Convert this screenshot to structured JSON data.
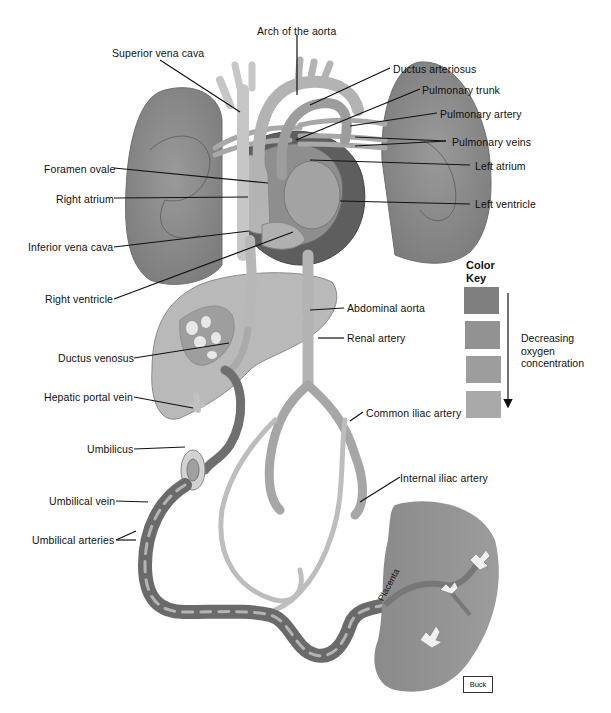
{
  "figure": {
    "labels_left": [
      {
        "id": "superior-vena-cava",
        "text": "Superior vena cava"
      },
      {
        "id": "foramen-ovale",
        "text": "Foramen ovale"
      },
      {
        "id": "right-atrium",
        "text": "Right atrium"
      },
      {
        "id": "inferior-vena-cava",
        "text": "Inferior vena cava"
      },
      {
        "id": "right-ventricle",
        "text": "Right ventricle"
      },
      {
        "id": "ductus-venosus",
        "text": "Ductus venosus"
      },
      {
        "id": "hepatic-portal-vein",
        "text": "Hepatic portal vein"
      },
      {
        "id": "umbilicus",
        "text": "Umbilicus"
      },
      {
        "id": "umbilical-vein",
        "text": "Umbilical vein"
      },
      {
        "id": "umbilical-arteries",
        "text": "Umbilical arteries"
      }
    ],
    "labels_top": [
      {
        "id": "arch-of-the-aorta",
        "text": "Arch of the aorta"
      }
    ],
    "labels_right": [
      {
        "id": "ductus-arteriosus",
        "text": "Ductus arteriosus"
      },
      {
        "id": "pulmonary-trunk",
        "text": "Pulmonary trunk"
      },
      {
        "id": "pulmonary-artery",
        "text": "Pulmonary artery"
      },
      {
        "id": "pulmonary-veins",
        "text": "Pulmonary veins"
      },
      {
        "id": "left-atrium",
        "text": "Left atrium"
      },
      {
        "id": "left-ventricle",
        "text": "Left ventricle"
      },
      {
        "id": "abdominal-aorta",
        "text": "Abdominal aorta"
      },
      {
        "id": "renal-artery",
        "text": "Renal artery"
      },
      {
        "id": "common-iliac-artery",
        "text": "Common iliac artery"
      },
      {
        "id": "internal-iliac-artery",
        "text": "Internal iliac artery"
      }
    ],
    "placenta_label": "Placenta",
    "credit": "Buck"
  },
  "color_key": {
    "title_line1": "Color",
    "title_line2": "Key",
    "swatches": [
      {
        "color": "#7f7f7f"
      },
      {
        "color": "#929292"
      },
      {
        "color": "#9d9d9d"
      },
      {
        "color": "#a9a9a9"
      }
    ],
    "description_line1": "Decreasing",
    "description_line2": "oxygen",
    "description_line3": "concentration",
    "arrow_direction": "down"
  }
}
